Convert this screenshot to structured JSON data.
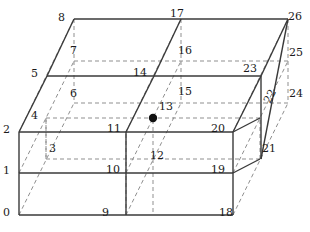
{
  "figure": {
    "type": "27-node hexahedral element node numbering diagram",
    "title": "",
    "center_node_marker": "filled-dot",
    "colors": {
      "solid_edge": "#3a3a3a",
      "hidden_edge": "#8f8f8f",
      "label_text": "#1a1a1a",
      "center_dot": "#111111",
      "background": "#ffffff"
    },
    "line_styles": {
      "solid_width": 1.4,
      "hidden_width": 1.0,
      "hidden_dash": "4,3"
    }
  },
  "geometry": {
    "origin": [
      19,
      215
    ],
    "x_axis": [
      214,
      0
    ],
    "y_axis": [
      55,
      -113
    ],
    "z_axis": [
      0,
      -83
    ],
    "divisions": 2
  },
  "nodes": [
    {
      "id": "0",
      "label": "0",
      "x": 19,
      "y": 215,
      "lx": 3,
      "ly": 207,
      "visible": true,
      "center": false
    },
    {
      "id": "1",
      "label": "1",
      "x": 19,
      "y": 173,
      "lx": 3,
      "ly": 165,
      "visible": true,
      "center": false
    },
    {
      "id": "2",
      "label": "2",
      "x": 19,
      "y": 132,
      "lx": 3,
      "ly": 124,
      "visible": true,
      "center": false
    },
    {
      "id": "3",
      "label": "3",
      "x": 46,
      "y": 159,
      "lx": 49,
      "ly": 143,
      "visible": false,
      "center": false
    },
    {
      "id": "4",
      "label": "4",
      "x": 46,
      "y": 118,
      "lx": 31,
      "ly": 110,
      "visible": false,
      "center": false
    },
    {
      "id": "5",
      "label": "5",
      "x": 47,
      "y": 76,
      "lx": 31,
      "ly": 68,
      "visible": true,
      "center": false
    },
    {
      "id": "6",
      "label": "6",
      "x": 74,
      "y": 103,
      "lx": 70,
      "ly": 88,
      "visible": false,
      "center": false
    },
    {
      "id": "7",
      "label": "7",
      "x": 74,
      "y": 61,
      "lx": 70,
      "ly": 45,
      "visible": false,
      "center": false
    },
    {
      "id": "8",
      "label": "8",
      "x": 74,
      "y": 19,
      "lx": 58,
      "ly": 12,
      "visible": true,
      "center": false
    },
    {
      "id": "9",
      "label": "9",
      "x": 126,
      "y": 215,
      "lx": 102,
      "ly": 207,
      "visible": true,
      "center": false
    },
    {
      "id": "10",
      "label": "10",
      "x": 126,
      "y": 173,
      "lx": 106,
      "ly": 164,
      "visible": true,
      "center": false
    },
    {
      "id": "11",
      "label": "11",
      "x": 126,
      "y": 132,
      "lx": 107,
      "ly": 123,
      "visible": true,
      "center": false
    },
    {
      "id": "12",
      "label": "12",
      "x": 153,
      "y": 159,
      "lx": 150,
      "ly": 150,
      "visible": false,
      "center": false
    },
    {
      "id": "13",
      "label": "13",
      "x": 153,
      "y": 118,
      "lx": 159,
      "ly": 101,
      "visible": false,
      "center": true
    },
    {
      "id": "14",
      "label": "14",
      "x": 154,
      "y": 76,
      "lx": 133,
      "ly": 67,
      "visible": true,
      "center": false
    },
    {
      "id": "15",
      "label": "15",
      "x": 181,
      "y": 103,
      "lx": 178,
      "ly": 86,
      "visible": false,
      "center": false
    },
    {
      "id": "16",
      "label": "16",
      "x": 181,
      "y": 61,
      "lx": 178,
      "ly": 45,
      "visible": false,
      "center": false
    },
    {
      "id": "17",
      "label": "17",
      "x": 181,
      "y": 19,
      "lx": 170,
      "ly": 8,
      "visible": true,
      "center": false
    },
    {
      "id": "18",
      "label": "18",
      "x": 233,
      "y": 215,
      "lx": 219,
      "ly": 207,
      "visible": true,
      "center": false
    },
    {
      "id": "19",
      "label": "19",
      "x": 233,
      "y": 173,
      "lx": 211,
      "ly": 164,
      "visible": true,
      "center": false
    },
    {
      "id": "20",
      "label": "20",
      "x": 233,
      "y": 132,
      "lx": 211,
      "ly": 123,
      "visible": true,
      "center": false
    },
    {
      "id": "21",
      "label": "21",
      "x": 260,
      "y": 159,
      "lx": 262,
      "ly": 143,
      "visible": true,
      "center": false
    },
    {
      "id": "22",
      "label": "22",
      "x": 260,
      "y": 118,
      "lx": 262,
      "ly": 100,
      "visible": true,
      "center": false,
      "rotated": true
    },
    {
      "id": "23",
      "label": "23",
      "x": 261,
      "y": 76,
      "lx": 243,
      "ly": 63,
      "visible": true,
      "center": false
    },
    {
      "id": "24",
      "label": "24",
      "x": 288,
      "y": 103,
      "lx": 289,
      "ly": 88,
      "visible": false,
      "center": false
    },
    {
      "id": "25",
      "label": "25",
      "x": 288,
      "y": 61,
      "lx": 289,
      "ly": 47,
      "visible": false,
      "center": false
    },
    {
      "id": "26",
      "label": "26",
      "x": 288,
      "y": 19,
      "lx": 288,
      "ly": 11,
      "visible": true,
      "center": false
    }
  ],
  "solid_edges": [
    [
      19,
      215,
      233,
      215
    ],
    [
      19,
      173,
      233,
      173
    ],
    [
      19,
      132,
      233,
      132
    ],
    [
      19,
      215,
      19,
      132
    ],
    [
      126,
      215,
      126,
      132
    ],
    [
      233,
      215,
      233,
      132
    ],
    [
      47,
      76,
      261,
      76
    ],
    [
      19,
      132,
      47,
      76
    ],
    [
      126,
      132,
      154,
      76
    ],
    [
      233,
      132,
      261,
      76
    ],
    [
      261,
      76,
      261,
      159
    ],
    [
      233,
      132,
      260,
      118
    ],
    [
      233,
      173,
      260,
      159
    ],
    [
      47,
      76,
      74,
      19
    ],
    [
      74,
      19,
      288,
      19
    ],
    [
      154,
      76,
      181,
      19
    ],
    [
      261,
      76,
      288,
      19
    ],
    [
      288,
      19,
      261,
      159
    ]
  ],
  "hidden_edges": [
    [
      19,
      215,
      74,
      103
    ],
    [
      126,
      215,
      181,
      103
    ],
    [
      233,
      215,
      288,
      103
    ],
    [
      46,
      159,
      260,
      159
    ],
    [
      46,
      118,
      260,
      118
    ],
    [
      74,
      103,
      288,
      103
    ],
    [
      74,
      61,
      288,
      61
    ],
    [
      74,
      19,
      74,
      103
    ],
    [
      181,
      19,
      181,
      103
    ],
    [
      288,
      19,
      288,
      103
    ],
    [
      126,
      132,
      181,
      19
    ],
    [
      19,
      132,
      74,
      19
    ],
    [
      233,
      132,
      288,
      19
    ],
    [
      126,
      215,
      126,
      132
    ],
    [
      46,
      159,
      46,
      118
    ],
    [
      153,
      159,
      153,
      118
    ],
    [
      260,
      159,
      260,
      118
    ],
    [
      153,
      159,
      153,
      215
    ],
    [
      46,
      118,
      46,
      159
    ],
    [
      19,
      173,
      74,
      61
    ],
    [
      126,
      173,
      181,
      61
    ],
    [
      233,
      173,
      288,
      61
    ]
  ]
}
